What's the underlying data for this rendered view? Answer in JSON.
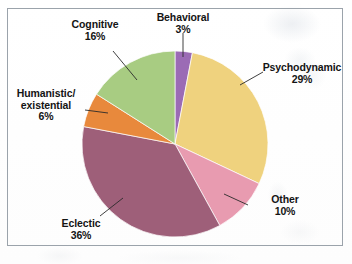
{
  "figure": {
    "background_color": "#ffffff",
    "frame_color": "#9ba3ab"
  },
  "chart_data": {
    "type": "pie",
    "title": "",
    "subtitle": "",
    "xlabel": "",
    "ylabel": "",
    "legend_position": "none",
    "labels_position": "outside-with-leader-lines",
    "grid": false,
    "units": "percent",
    "total": 100,
    "start_angle_deg": -90,
    "direction": "clockwise",
    "categories": [
      "Behavioral",
      "Psychodynamic",
      "Other",
      "Eclectic",
      "Humanistic/existential",
      "Cognitive"
    ],
    "values": [
      3,
      29,
      10,
      36,
      6,
      16
    ],
    "colors": [
      "#9b6bb5",
      "#efd27e",
      "#e89bb0",
      "#9e5f79",
      "#e8893c",
      "#a8cc82"
    ],
    "slices": [
      {
        "name": "Behavioral",
        "label": "Behavioral",
        "value": 3,
        "percent_label": "3%",
        "color": "#9b6bb5"
      },
      {
        "name": "Psychodynamic",
        "label": "Psychodynamic",
        "value": 29,
        "percent_label": "29%",
        "color": "#efd27e"
      },
      {
        "name": "Other",
        "label": "Other",
        "value": 10,
        "percent_label": "10%",
        "color": "#e89bb0"
      },
      {
        "name": "Eclectic",
        "label": "Eclectic",
        "value": 36,
        "percent_label": "36%",
        "color": "#9e5f79"
      },
      {
        "name": "Humanistic/existential",
        "label_line1": "Humanistic/",
        "label_line2": "existential",
        "value": 6,
        "percent_label": "6%",
        "color": "#e8893c"
      },
      {
        "name": "Cognitive",
        "label": "Cognitive",
        "value": 16,
        "percent_label": "16%",
        "color": "#a8cc82"
      }
    ]
  }
}
